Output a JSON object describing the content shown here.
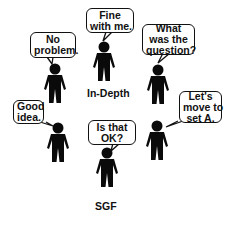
{
  "figures": [
    {
      "id": "top-left",
      "speech": [
        "No",
        "problem."
      ]
    },
    {
      "id": "top-center",
      "speech": [
        "Fine",
        "with me."
      ],
      "label": "In-Depth"
    },
    {
      "id": "top-right",
      "speech": [
        "What",
        "was the",
        "question?"
      ]
    },
    {
      "id": "mid-left",
      "speech": [
        "Good",
        "idea."
      ]
    },
    {
      "id": "mid-right",
      "speech": [
        "Let's",
        "move to",
        "set A."
      ]
    },
    {
      "id": "bottom-center",
      "speech": [
        "Is that",
        "OK?"
      ],
      "label": "SGF"
    }
  ],
  "colors": {
    "figure": "#0a0a0a",
    "background": "#ffffff",
    "outline": "#111111"
  }
}
